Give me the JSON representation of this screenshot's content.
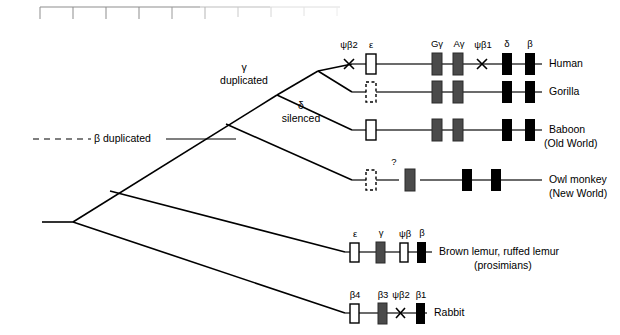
{
  "figure": {
    "type": "phylogenetic-gene-cluster-diagram",
    "ruler": {
      "visible": true,
      "tick_count": 10,
      "x_start": 40,
      "x_end": 340
    },
    "events": [
      {
        "name": "beta-duplicated",
        "label": "β duplicated",
        "x": 115,
        "y": 139
      },
      {
        "name": "gamma-duplicated",
        "label_line1": "γ",
        "label_line2": "duplicated",
        "x": 244,
        "y": 74
      },
      {
        "name": "delta-silenced",
        "label_line1": "δ",
        "label_line2": "silenced",
        "x": 300,
        "y": 112
      }
    ],
    "species": [
      {
        "name": "human",
        "label": "Human",
        "sublabel": "",
        "line_y": 64,
        "line_x1": 352,
        "line_x2": 542,
        "gene_labels": [
          {
            "text": "ψβ2",
            "x": 349
          },
          {
            "text": "ε",
            "x": 371
          },
          {
            "text": "Gγ",
            "x": 437
          },
          {
            "text": "Aγ",
            "x": 458
          },
          {
            "text": "ψβ1",
            "x": 482
          },
          {
            "text": "δ",
            "x": 507
          },
          {
            "text": "β",
            "x": 530
          }
        ],
        "genes": [
          {
            "kind": "cross",
            "x": 349
          },
          {
            "kind": "white",
            "x": 371
          },
          {
            "kind": "gray",
            "x": 437
          },
          {
            "kind": "gray",
            "x": 458
          },
          {
            "kind": "cross",
            "x": 482
          },
          {
            "kind": "black",
            "x": 507
          },
          {
            "kind": "black",
            "x": 530
          }
        ]
      },
      {
        "name": "gorilla",
        "label": "Gorilla",
        "sublabel": "",
        "line_y": 92,
        "line_x1": 352,
        "line_x2": 542,
        "gene_labels": [],
        "genes": [
          {
            "kind": "dashed",
            "x": 371
          },
          {
            "kind": "gray",
            "x": 437
          },
          {
            "kind": "gray",
            "x": 458
          },
          {
            "kind": "black",
            "x": 507
          },
          {
            "kind": "black",
            "x": 530
          }
        ]
      },
      {
        "name": "baboon",
        "label": "Baboon",
        "sublabel": "(Old World)",
        "line_y": 130,
        "line_x1": 352,
        "line_x2": 542,
        "gene_labels": [],
        "genes": [
          {
            "kind": "white",
            "x": 371
          },
          {
            "kind": "gray",
            "x": 437
          },
          {
            "kind": "gray",
            "x": 458
          },
          {
            "kind": "black",
            "x": 507
          },
          {
            "kind": "black",
            "x": 530
          }
        ]
      },
      {
        "name": "owl-monkey",
        "label": "Owl monkey",
        "sublabel": "(New World)",
        "line_y": 180,
        "line_x1": 352,
        "line_x2": 542,
        "line_gap_x1": 399,
        "line_gap_x2": 420,
        "gene_labels": [
          {
            "text": "?",
            "x": 394
          }
        ],
        "genes": [
          {
            "kind": "dashed",
            "x": 371
          },
          {
            "kind": "gray",
            "x": 410
          },
          {
            "kind": "black",
            "x": 467
          },
          {
            "kind": "black",
            "x": 496
          }
        ]
      },
      {
        "name": "lemurs",
        "label": "Brown lemur, ruffed lemur",
        "sublabel": "(prosimians)",
        "line_y": 252,
        "line_x1": 345,
        "line_x2": 432,
        "gene_labels": [
          {
            "text": "ε",
            "x": 354
          },
          {
            "text": "γ",
            "x": 380
          },
          {
            "text": "ψβ",
            "x": 404
          },
          {
            "text": "β",
            "x": 421
          }
        ],
        "genes": [
          {
            "kind": "white",
            "x": 354
          },
          {
            "kind": "gray",
            "x": 380
          },
          {
            "kind": "white",
            "x": 404
          },
          {
            "kind": "black",
            "x": 421
          }
        ]
      },
      {
        "name": "rabbit",
        "label": "Rabbit",
        "sublabel": "",
        "line_y": 313,
        "line_x1": 345,
        "line_x2": 427,
        "gene_labels": [
          {
            "text": "β4",
            "x": 354
          },
          {
            "text": "β3",
            "x": 382
          },
          {
            "text": "ψβ2",
            "x": 400
          },
          {
            "text": "β1",
            "x": 420
          }
        ],
        "genes": [
          {
            "kind": "white",
            "x": 354
          },
          {
            "kind": "gray",
            "x": 382
          },
          {
            "kind": "cross",
            "x": 400
          },
          {
            "kind": "black",
            "x": 420
          }
        ]
      }
    ],
    "colors": {
      "line": "#000000",
      "gene_black": "#000000",
      "gene_gray": "#4a4a4a",
      "gene_white": "#ffffff",
      "ruler": "#9a9a9a",
      "cluster_line": "#3a3a3a"
    }
  }
}
